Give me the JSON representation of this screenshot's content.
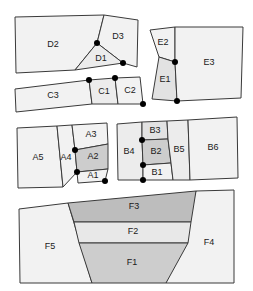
{
  "figure": {
    "width": 253,
    "height": 291,
    "background": "#ffffff",
    "stroke_color": "#3a3a3a",
    "vertex_dot_color": "#000000",
    "fills": {
      "light": "#f2f2f2",
      "pale": "#ececec",
      "medium_light": "#e2e2e2",
      "medium": "#cdcdcd",
      "dark": "#bdbdbd"
    },
    "groups": [
      {
        "id": "D",
        "name": "group-d",
        "label": "D cluster"
      },
      {
        "id": "E",
        "name": "group-e",
        "label": "E cluster"
      },
      {
        "id": "C",
        "name": "group-c",
        "label": "C cluster"
      },
      {
        "id": "A",
        "name": "group-a",
        "label": "A cluster"
      },
      {
        "id": "B",
        "name": "group-b",
        "label": "B cluster"
      },
      {
        "id": "F",
        "name": "group-f",
        "label": "F cluster"
      }
    ],
    "regions": [
      {
        "id": "D2",
        "label": "D2",
        "group": "D",
        "fill": "#f2f2f2",
        "points": "15,17 104,15 97,43 75,70 16,73",
        "label_x": 53,
        "label_y": 45
      },
      {
        "id": "D3",
        "label": "D3",
        "group": "D",
        "fill": "#f2f2f2",
        "points": "104,15 138,20 137,67 123,63 97,43",
        "label_x": 118,
        "label_y": 37
      },
      {
        "id": "D1",
        "label": "D1",
        "group": "D",
        "fill": "#ececec",
        "points": "97,43 123,63 75,70",
        "label_x": 101,
        "label_y": 59
      },
      {
        "id": "E2",
        "label": "E2",
        "group": "E",
        "fill": "#f2f2f2",
        "points": "150,30 175,27 175,62 159,57",
        "label_x": 163,
        "label_y": 43
      },
      {
        "id": "E1",
        "label": "E1",
        "group": "E",
        "fill": "#e2e2e2",
        "points": "159,57 175,62 177,101 152,99",
        "label_x": 165,
        "label_y": 80
      },
      {
        "id": "E3",
        "label": "E3",
        "group": "E",
        "fill": "#f2f2f2",
        "points": "175,27 243,27 241,98 177,101 175,62",
        "label_x": 209,
        "label_y": 63
      },
      {
        "id": "C3",
        "label": "C3",
        "group": "C",
        "fill": "#f2f2f2",
        "points": "15,89 89,80 92,104 16,112",
        "label_x": 53,
        "label_y": 96
      },
      {
        "id": "C1",
        "label": "C1",
        "group": "C",
        "fill": "#ececec",
        "points": "89,80 115,78 118,104 92,104",
        "label_x": 104,
        "label_y": 92
      },
      {
        "id": "C2",
        "label": "C2",
        "group": "C",
        "fill": "#f2f2f2",
        "points": "115,78 140,77 143,104 118,104",
        "label_x": 130,
        "label_y": 91
      },
      {
        "id": "A5",
        "label": "A5",
        "group": "A",
        "fill": "#f2f2f2",
        "points": "17,128 57,126 63,187 18,188",
        "label_x": 38,
        "label_y": 158
      },
      {
        "id": "A4",
        "label": "A4",
        "group": "A",
        "fill": "#f2f2f2",
        "points": "57,126 72,125 75,150 77,172 63,187",
        "label_x": 66,
        "label_y": 158
      },
      {
        "id": "A3",
        "label": "A3",
        "group": "A",
        "fill": "#f2f2f2",
        "points": "72,125 107,123 108,144 75,150",
        "label_x": 91,
        "label_y": 135
      },
      {
        "id": "A2",
        "label": "A2",
        "group": "A",
        "fill": "#cdcdcd",
        "points": "75,150 108,144 108,169 77,172",
        "label_x": 93,
        "label_y": 157
      },
      {
        "id": "A1",
        "label": "A1",
        "group": "A",
        "fill": "#f2f2f2",
        "points": "77,172 108,169 105,181 78,183",
        "label_x": 93,
        "label_y": 176
      },
      {
        "id": "B4",
        "label": "B4",
        "group": "B",
        "fill": "#ececec",
        "points": "117,124 142,122 142,140 143,165 143,180 118,180",
        "label_x": 129,
        "label_y": 152
      },
      {
        "id": "B3",
        "label": "B3",
        "group": "B",
        "fill": "#e2e2e2",
        "points": "142,122 167,121 168,139 142,140",
        "label_x": 155,
        "label_y": 131
      },
      {
        "id": "B2",
        "label": "B2",
        "group": "B",
        "fill": "#cdcdcd",
        "points": "142,140 168,139 171,163 143,165",
        "label_x": 156,
        "label_y": 152
      },
      {
        "id": "B1",
        "label": "B1",
        "group": "B",
        "fill": "#f2f2f2",
        "points": "143,165 171,163 173,180 143,180",
        "label_x": 157,
        "label_y": 173
      },
      {
        "id": "B5",
        "label": "B5",
        "group": "B",
        "fill": "#ececec",
        "points": "167,121 188,120 190,180 173,180 171,163 168,139",
        "label_x": 179,
        "label_y": 150
      },
      {
        "id": "B6",
        "label": "B6",
        "group": "B",
        "fill": "#f2f2f2",
        "points": "188,120 237,117 238,178 190,180",
        "label_x": 213,
        "label_y": 148
      },
      {
        "id": "F5",
        "label": "F5",
        "group": "F",
        "fill": "#f2f2f2",
        "points": "19,209 68,203 92,283 20,283",
        "label_x": 50,
        "label_y": 247
      },
      {
        "id": "F4",
        "label": "F4",
        "group": "F",
        "fill": "#f2f2f2",
        "points": "196,191 234,190 234,283 166,283",
        "label_x": 209,
        "label_y": 243
      },
      {
        "id": "F3",
        "label": "F3",
        "group": "F",
        "fill": "#bdbdbd",
        "points": "68,203 196,191 191,222 74,222",
        "label_x": 134,
        "label_y": 207
      },
      {
        "id": "F2",
        "label": "F2",
        "group": "F",
        "fill": "#e8e8e8",
        "points": "74,222 191,222 188,243 79,243",
        "label_x": 133,
        "label_y": 232
      },
      {
        "id": "F1",
        "label": "F1",
        "group": "F",
        "fill": "#cdcdcd",
        "points": "79,243 188,243 166,283 92,283",
        "label_x": 132,
        "label_y": 263
      }
    ],
    "vertex_dots": [
      {
        "name": "vertex-d1-apex",
        "x": 97,
        "y": 43,
        "r": 3
      },
      {
        "name": "vertex-d1-right",
        "x": 123,
        "y": 63,
        "r": 3
      },
      {
        "name": "vertex-c3-c1",
        "x": 89,
        "y": 80,
        "r": 3
      },
      {
        "name": "vertex-c1-c2",
        "x": 115,
        "y": 78,
        "r": 3
      },
      {
        "name": "vertex-c2-corner",
        "x": 143,
        "y": 104,
        "r": 3
      },
      {
        "name": "vertex-e-upper",
        "x": 175,
        "y": 62,
        "r": 3
      },
      {
        "name": "vertex-e-lower",
        "x": 177,
        "y": 101,
        "r": 3
      },
      {
        "name": "vertex-a3-a2",
        "x": 75,
        "y": 150,
        "r": 3
      },
      {
        "name": "vertex-a2-a1",
        "x": 77,
        "y": 172,
        "r": 3
      },
      {
        "name": "vertex-a1-corner",
        "x": 105,
        "y": 181,
        "r": 3
      },
      {
        "name": "vertex-b3-b2",
        "x": 142,
        "y": 140,
        "r": 3
      },
      {
        "name": "vertex-b2-b1",
        "x": 143,
        "y": 165,
        "r": 3
      },
      {
        "name": "vertex-b1-corner",
        "x": 143,
        "y": 180,
        "r": 3
      }
    ]
  }
}
